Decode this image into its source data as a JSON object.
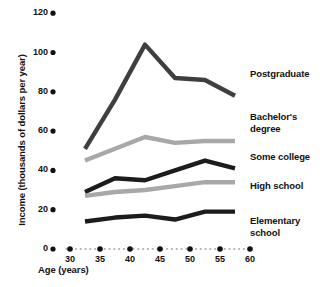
{
  "chart_data": {
    "type": "line",
    "title": "",
    "xlabel": "Age (years)",
    "ylabel": "Income (thousands of dollars per year)",
    "xlim": [
      27.5,
      60
    ],
    "ylim": [
      0,
      120
    ],
    "xticks": [
      30,
      35,
      40,
      45,
      50,
      55,
      60
    ],
    "yticks": [
      0,
      20,
      40,
      60,
      80,
      100,
      120
    ],
    "xtick_labels": [
      "30",
      "35",
      "40",
      "45",
      "50",
      "55",
      "60"
    ],
    "ytick_labels": [
      "0",
      "20",
      "40",
      "60",
      "80",
      "100",
      "120"
    ],
    "grid": false,
    "legend_position": "inline-right",
    "x": [
      32.5,
      37.5,
      42.5,
      47.5,
      52.5,
      57.5
    ],
    "series": [
      {
        "name": "Postgraduate",
        "color": "#3f3f3f",
        "values": [
          51,
          76,
          104,
          87,
          86,
          78
        ],
        "label_x": 59,
        "label_y": 89
      },
      {
        "name": "Bachelor's\ndegree",
        "color": "#a8a8a8",
        "values": [
          45,
          51,
          57,
          54,
          55,
          55
        ],
        "label_x": 59,
        "label_y": 67
      },
      {
        "name": "Some college",
        "color": "#1c1c1c",
        "values": [
          29,
          36,
          35,
          40,
          45,
          41
        ],
        "label_x": 59,
        "label_y": 47
      },
      {
        "name": "High school",
        "color": "#a8a8a8",
        "values": [
          27,
          29,
          30,
          32,
          34,
          34
        ],
        "label_x": 59,
        "label_y": 32
      },
      {
        "name": "Elementary\nschool",
        "color": "#1c1c1c",
        "values": [
          14,
          16,
          17,
          15,
          19,
          19
        ],
        "label_x": 59,
        "label_y": 14
      }
    ]
  },
  "axis": {
    "x_title": "Age (years)",
    "y_title": "Income (thousands of dollars per year)"
  },
  "series_labels": {
    "postgraduate": "Postgraduate",
    "bachelors": "Bachelor's\ndegree",
    "some_college": "Some college",
    "high_school": "High school",
    "elementary": "Elementary\nschool"
  },
  "style": {
    "dark_line": "#2a2a2a",
    "light_line": "#a8a8a8",
    "tick_dot": "#111111",
    "dotted_axis": "#9a9a9a"
  }
}
